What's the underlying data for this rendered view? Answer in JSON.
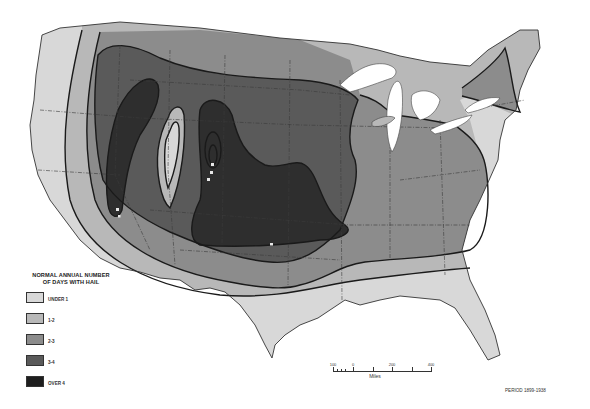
{
  "map": {
    "subject": "Contiguous United States - normal annual number of days with hail",
    "colors": {
      "background": "#ffffff",
      "water": "#ffffff",
      "under_1": "#d8d8d8",
      "1_2": "#b8b8b8",
      "2_3": "#8c8c8c",
      "3_4": "#5a5a5a",
      "over_4": "#2e2e2e",
      "contour_line": "#1a1a1a",
      "state_line": "#3a3a3a"
    }
  },
  "legend": {
    "title_line1": "NORMAL ANNUAL NUMBER",
    "title_line2": "OF DAYS WITH HAIL",
    "items": [
      {
        "label": "UNDER 1",
        "color": "#d8d8d8"
      },
      {
        "label": "1-2",
        "color": "#b8b8b8"
      },
      {
        "label": "2-3",
        "color": "#8c8c8c"
      },
      {
        "label": "3-4",
        "color": "#5a5a5a"
      },
      {
        "label": "OVER 4",
        "color": "#1e1e1e"
      }
    ]
  },
  "scale_bar": {
    "labels": [
      "100",
      "0",
      "200",
      "400"
    ],
    "unit": "Miles"
  },
  "period": "PERIOD 1899-1938"
}
